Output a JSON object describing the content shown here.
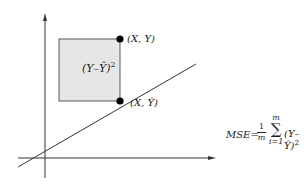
{
  "diagram": {
    "type": "linear-regression-squared-error",
    "colors": {
      "axis": "#333333",
      "line": "#333333",
      "square_fill": "#e6e6e6",
      "square_stroke": "#333333",
      "point": "#000000",
      "text": "#222222"
    },
    "points": {
      "actual": {
        "label": "(X, Y)"
      },
      "predicted": {
        "label": "(X, Ŷ)"
      }
    },
    "square": {
      "label": "(Y–Ŷ)",
      "exponent": "2"
    },
    "formula": {
      "name": "MSE=",
      "frac_num": "1",
      "frac_den": "m",
      "sum_top": "m",
      "sum_symbol": "∑",
      "sum_bottom": "i=1",
      "term": "(Y–Ŷ)",
      "exponent": "2"
    }
  }
}
